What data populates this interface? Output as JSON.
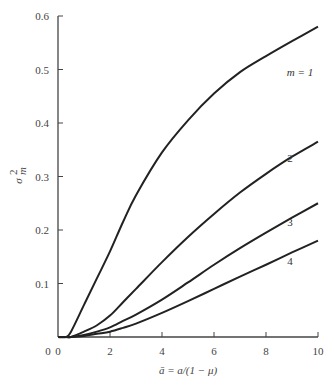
{
  "chart_data": {
    "type": "line",
    "title": "",
    "xlabel": "ā = a/(1 − μ)",
    "ylabel": "σ²_m",
    "xlim": [
      0,
      10
    ],
    "ylim": [
      0,
      0.6
    ],
    "xticks": [
      0,
      2,
      4,
      6,
      8,
      10
    ],
    "yticks": [
      0.1,
      0.2,
      0.3,
      0.4,
      0.5,
      0.6
    ],
    "xtick_labels": [
      "0",
      "2",
      "4",
      "6",
      "8",
      "10"
    ],
    "ytick_labels": [
      "0.1",
      "0.2",
      "0.3",
      "0.4",
      "0.5",
      "0.6"
    ],
    "origin_label": "0",
    "grid": false,
    "legend": "inline labels at right end of curves",
    "x": [
      0,
      0.3,
      0.5,
      1,
      1.5,
      2,
      2.5,
      3,
      4,
      5,
      6,
      7,
      8,
      9,
      10
    ],
    "series": [
      {
        "name": "m = 1",
        "label": "m = 1",
        "values": [
          0,
          0,
          0.01,
          0.06,
          0.11,
          0.16,
          0.215,
          0.265,
          0.345,
          0.405,
          0.455,
          0.495,
          0.525,
          0.553,
          0.58
        ]
      },
      {
        "name": "m = 2",
        "label": "2",
        "values": [
          0,
          0,
          0,
          0.01,
          0.022,
          0.04,
          0.065,
          0.09,
          0.14,
          0.187,
          0.23,
          0.27,
          0.305,
          0.337,
          0.365
        ]
      },
      {
        "name": "m = 3",
        "label": "3",
        "values": [
          0,
          0,
          0,
          0.004,
          0.01,
          0.018,
          0.03,
          0.042,
          0.07,
          0.102,
          0.135,
          0.166,
          0.195,
          0.223,
          0.25
        ]
      },
      {
        "name": "m = 4",
        "label": "4",
        "values": [
          0,
          0,
          0,
          0.002,
          0.006,
          0.01,
          0.017,
          0.025,
          0.045,
          0.067,
          0.09,
          0.113,
          0.135,
          0.158,
          0.18
        ]
      }
    ]
  },
  "colors": {
    "line": "#222222",
    "axis": "#444444",
    "text": "#444444"
  }
}
